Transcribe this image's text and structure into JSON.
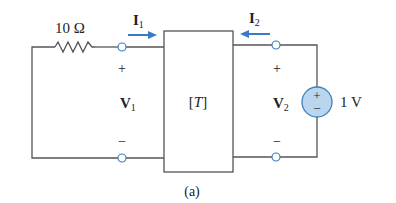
{
  "diagram": {
    "type": "two-port network circuit",
    "caption": "(a)",
    "resistor": {
      "label": "10 Ω"
    },
    "network": {
      "label": "[T]",
      "label_open": "[",
      "label_var": "T",
      "label_close": "]"
    },
    "port1": {
      "current": {
        "symbol": "I",
        "subscript": "1",
        "direction": "into network"
      },
      "voltage": {
        "symbol": "V",
        "subscript": "1"
      },
      "plus": "+",
      "minus": "−"
    },
    "port2": {
      "current": {
        "symbol": "I",
        "subscript": "2",
        "direction": "into network"
      },
      "voltage": {
        "symbol": "V",
        "subscript": "2"
      },
      "plus": "+",
      "minus": "−"
    },
    "source": {
      "label": "1 V",
      "plus": "+",
      "minus": "−",
      "fill": "#b9d6ee",
      "stroke": "#3f7fbf"
    },
    "colors": {
      "wire": "#555555",
      "arrow": "#3a7cc4",
      "terminal": "#3f7fbf"
    }
  }
}
